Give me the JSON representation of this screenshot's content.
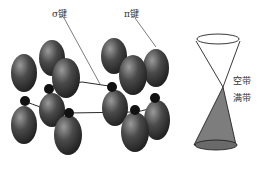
{
  "diagram": {
    "labels": {
      "sigma_bond": "σ键",
      "pi_bond": "π键",
      "conduction_band": "空带",
      "valence_band": "满带"
    },
    "colors": {
      "orbital": "#3a3a3a",
      "orbital_highlight": "#8a8a8a",
      "valence_fill": "#7d7d7d",
      "line": "#333333"
    }
  }
}
